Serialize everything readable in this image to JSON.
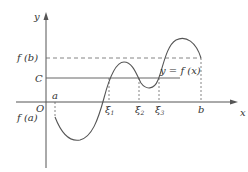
{
  "diagram": {
    "axes": {
      "x_label": "x",
      "y_label": "y",
      "origin_label": "O"
    },
    "y_labels": {
      "fb": "f (b)",
      "c": "C",
      "fa": "f (a)"
    },
    "x_labels": {
      "a": "a",
      "xi1": "ξ",
      "xi1_sub": "1",
      "xi2": "ξ",
      "xi2_sub": "2",
      "xi3": "ξ",
      "xi3_sub": "3",
      "b": "b"
    },
    "curve_label": "y = f (x)",
    "colors": {
      "line": "#555555",
      "text": "#333333",
      "background": "#ffffff"
    }
  }
}
